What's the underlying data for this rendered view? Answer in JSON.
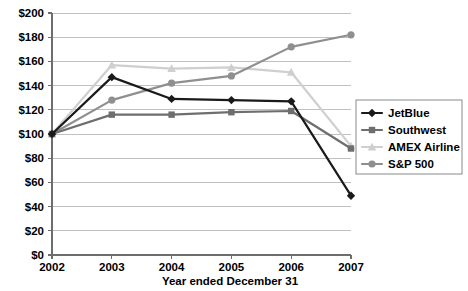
{
  "chart_data": {
    "type": "line",
    "title": "",
    "xlabel": "Year ended December 31",
    "ylabel": "",
    "categories": [
      "2002",
      "2003",
      "2004",
      "2005",
      "2006",
      "2007"
    ],
    "x_tick_labels": [
      "2002",
      "2003",
      "2004",
      "2005",
      "2006",
      "2007"
    ],
    "y_tick_labels": [
      "$0",
      "$20",
      "$40",
      "$60",
      "$80",
      "$100",
      "$120",
      "$140",
      "$160",
      "$180",
      "$200"
    ],
    "y_tick_values": [
      0,
      20,
      40,
      60,
      80,
      100,
      120,
      140,
      160,
      180,
      200
    ],
    "ylim": [
      0,
      200
    ],
    "grid": true,
    "grid_axis": "y",
    "legend_position": "right",
    "series": [
      {
        "name": "JetBlue",
        "marker": "diamond",
        "color": "#1a1a1a",
        "values": [
          100,
          147,
          129,
          128,
          127,
          49
        ]
      },
      {
        "name": "Southwest",
        "marker": "square",
        "color": "#6e6e6e",
        "values": [
          100,
          116,
          116,
          118,
          119,
          88
        ]
      },
      {
        "name": "AMEX Airline",
        "marker": "triangle",
        "color": "#cfcfcf",
        "values": [
          100,
          157,
          154,
          155,
          151,
          90
        ]
      },
      {
        "name": "S&P 500",
        "marker": "circle",
        "color": "#8f8f8f",
        "values": [
          100,
          128,
          142,
          148,
          172,
          182
        ]
      }
    ]
  },
  "legend": {
    "entries": [
      {
        "label": "JetBlue",
        "color": "#1a1a1a",
        "marker": "diamond"
      },
      {
        "label": "Southwest",
        "color": "#6e6e6e",
        "marker": "square"
      },
      {
        "label": "AMEX Airline",
        "color": "#cfcfcf",
        "marker": "triangle"
      },
      {
        "label": "S&P 500",
        "color": "#8f8f8f",
        "marker": "circle"
      }
    ]
  },
  "axes": {
    "x_title": "Year ended December 31"
  }
}
